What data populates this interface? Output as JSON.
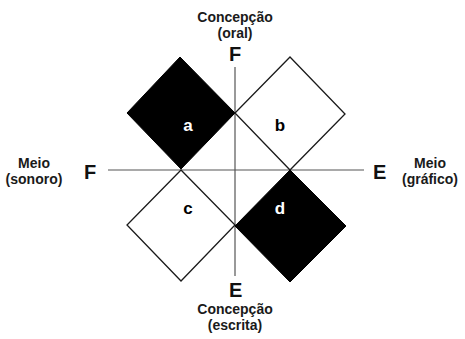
{
  "diagram": {
    "axes": {
      "vertical": {
        "top_label": {
          "line1": "Concepção",
          "line2": "(oral)"
        },
        "top_pole": "F",
        "bottom_label": {
          "line1": "Concepção",
          "line2": "(escrita)"
        },
        "bottom_pole": "E"
      },
      "horizontal": {
        "left_label": {
          "line1": "Meio",
          "line2": "(sonoro)"
        },
        "left_pole": "F",
        "right_label": {
          "line1": "Meio",
          "line2": "(gráfico)"
        },
        "right_pole": "E"
      }
    },
    "quadrants": [
      {
        "id": "a",
        "label": "a",
        "fill": "#000000",
        "text_color": "#ffffff"
      },
      {
        "id": "b",
        "label": "b",
        "fill": "#ffffff",
        "text_color": "#000000"
      },
      {
        "id": "c",
        "label": "c",
        "fill": "#ffffff",
        "text_color": "#000000"
      },
      {
        "id": "d",
        "label": "d",
        "fill": "#000000",
        "text_color": "#ffffff"
      }
    ],
    "colors": {
      "line": "#222222",
      "axis": "#555555",
      "background": "#ffffff"
    }
  }
}
